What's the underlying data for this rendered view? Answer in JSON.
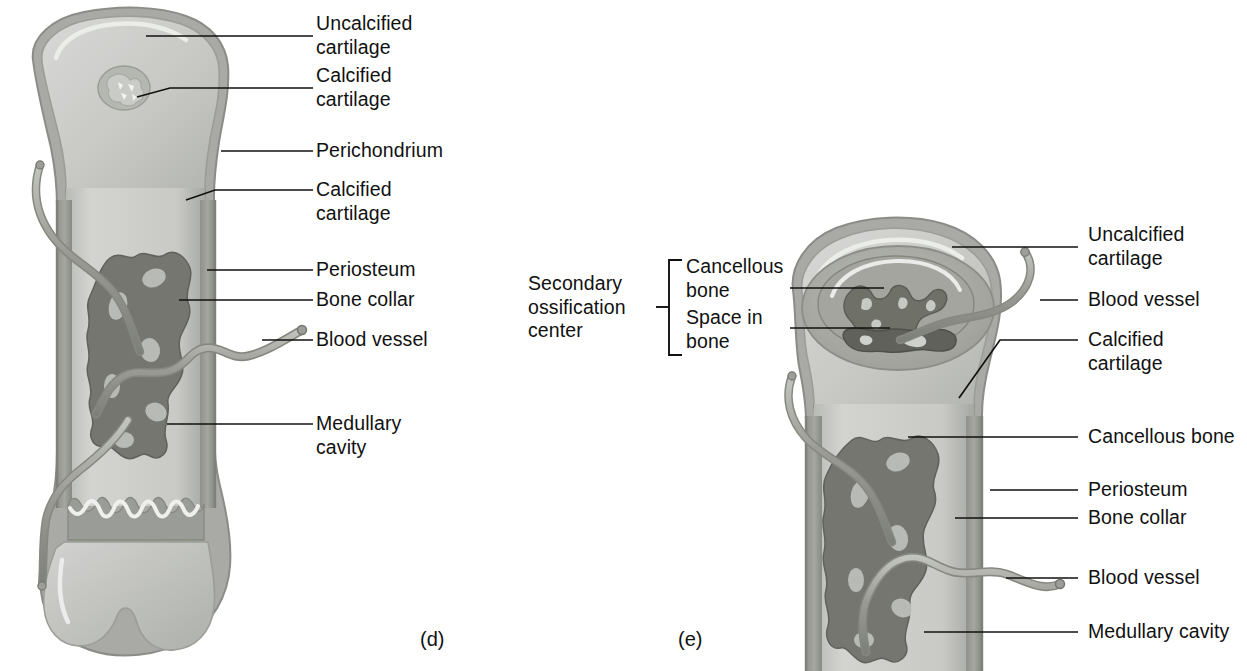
{
  "figure": {
    "panels": [
      {
        "id": "d",
        "caption": "(d)",
        "labels": [
          {
            "name": "uncalcified-cartilage",
            "lines": [
              "Uncalcified",
              "cartilage"
            ],
            "text": "Uncalcified cartilage"
          },
          {
            "name": "calcified-cartilage-epiphysis",
            "lines": [
              "Calcified",
              "cartilage"
            ],
            "text": "Calcified cartilage"
          },
          {
            "name": "perichondrium",
            "lines": [
              "Perichondrium"
            ],
            "text": "Perichondrium"
          },
          {
            "name": "calcified-cartilage-metaphysis",
            "lines": [
              "Calcified",
              "cartilage"
            ],
            "text": "Calcified cartilage"
          },
          {
            "name": "periosteum",
            "lines": [
              "Periosteum"
            ],
            "text": "Periosteum"
          },
          {
            "name": "bone-collar",
            "lines": [
              "Bone collar"
            ],
            "text": "Bone collar"
          },
          {
            "name": "blood-vessel",
            "lines": [
              "Blood vessel"
            ],
            "text": "Blood vessel"
          },
          {
            "name": "medullary-cavity",
            "lines": [
              "Medullary",
              "cavity"
            ],
            "text": "Medullary cavity"
          }
        ]
      },
      {
        "id": "e",
        "caption": "(e)",
        "bracket_label": {
          "name": "secondary-ossification-center",
          "lines": [
            "Secondary",
            "ossification",
            "center"
          ],
          "text": "Secondary ossification center"
        },
        "bracket_items": [
          {
            "name": "cancellous-bone-epiphysis",
            "lines": [
              "Cancellous",
              "bone"
            ],
            "text": "Cancellous bone"
          },
          {
            "name": "space-in-bone",
            "lines": [
              "Space in",
              "bone"
            ],
            "text": "Space in bone"
          }
        ],
        "labels": [
          {
            "name": "uncalcified-cartilage",
            "lines": [
              "Uncalcified",
              "cartilage"
            ],
            "text": "Uncalcified cartilage"
          },
          {
            "name": "blood-vessel-epiphysis",
            "lines": [
              "Blood vessel"
            ],
            "text": "Blood vessel"
          },
          {
            "name": "calcified-cartilage",
            "lines": [
              "Calcified",
              "cartilage"
            ],
            "text": "Calcified cartilage"
          },
          {
            "name": "cancellous-bone-diaphysis",
            "lines": [
              "Cancellous bone"
            ],
            "text": "Cancellous bone"
          },
          {
            "name": "periosteum",
            "lines": [
              "Periosteum"
            ],
            "text": "Periosteum"
          },
          {
            "name": "bone-collar",
            "lines": [
              "Bone collar"
            ],
            "text": "Bone collar"
          },
          {
            "name": "blood-vessel-diaphysis",
            "lines": [
              "Blood vessel"
            ],
            "text": "Blood vessel"
          },
          {
            "name": "medullary-cavity",
            "lines": [
              "Medullary cavity"
            ],
            "text": "Medullary cavity"
          }
        ]
      }
    ]
  },
  "colors": {
    "background": "#ffffff",
    "ink": "#111111",
    "cartilage_light": "#cfd0cd",
    "cartilage_mid": "#bcbdba",
    "perichondrium": "#a9aaa6",
    "calcified_cartilage": "#9a9c97",
    "bone_collar": "#8e9089",
    "cancellous_dark": "#74766f",
    "marrow_dark": "#6b6d66",
    "medullary_light": "#c8c9c5",
    "vessel": "#9b9d96",
    "highlight": "#efefed"
  }
}
